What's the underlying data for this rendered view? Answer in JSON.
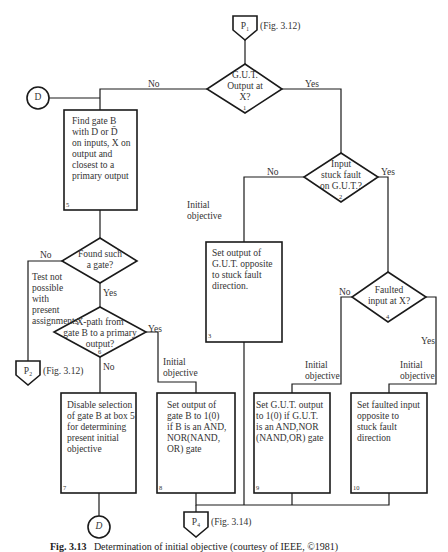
{
  "connectors": {
    "p1": {
      "label": "P₁",
      "ref": "(Fig. 3.12)"
    },
    "p2": {
      "label": "P₂",
      "ref": "(Fig. 3.12)"
    },
    "p4": {
      "label": "P₄",
      "ref": "(Fig. 3.14)"
    },
    "d_top": {
      "label": "D"
    },
    "d_bottom": {
      "label": "D"
    }
  },
  "decisions": [
    {
      "id": "1",
      "text": "G.U.T.\nOutput at\nX?",
      "number": "1"
    },
    {
      "id": "2",
      "text": "Input\nstuck fault\non G.U.T.?",
      "number": "2"
    },
    {
      "id": "4",
      "text": "Faulted\ninput at X?",
      "number": "4"
    },
    {
      "id": "found",
      "text": "Found such\na gate?"
    },
    {
      "id": "6",
      "text": "X-path from\ngate B to a primary\noutput?",
      "number": "6"
    }
  ],
  "processes": [
    {
      "id": "3",
      "text": "Set output of\nG.U.T. opposite\nto stuck fault\ndirection.",
      "number": "3"
    },
    {
      "id": "5",
      "text": "Find gate B\nwith D or D̄\non inputs, X on\noutput and\nclosest to a\nprimary output",
      "number": "5"
    },
    {
      "id": "7",
      "text": "Disable selection\nof gate B at box 5\nfor determining\npresent initial\nobjective",
      "number": "7"
    },
    {
      "id": "8",
      "text": "Set output of\ngate B to 1(0)\nif B is an AND,\nNOR(NAND,\nOR) gate",
      "number": "8"
    },
    {
      "id": "9",
      "text": "Set G.U.T. output\nto 1(0) if G.U.T.\nis an AND,NOR\n(NAND,OR) gate",
      "number": "9"
    },
    {
      "id": "10",
      "text": "Set faulted input\nopposite to\nstuck fault\ndirection",
      "number": "10"
    }
  ],
  "edge_labels": {
    "d1_no": "No",
    "d1_yes": "Yes",
    "d2_no": "No",
    "d2_yes": "Yes",
    "d4_no": "No",
    "d4_yes": "Yes",
    "found_no": "No",
    "found_yes": "Yes",
    "d6_yes": "Yes",
    "d6_no": "No",
    "initial_objective_3": "Initial\nobjective",
    "initial_objective_8": "Initial\nobjective",
    "initial_objective_9": "Initial\nobjective",
    "initial_objective_10": "Initial\nobjective",
    "test_not_possible": "Test not\npossible\nwith\npresent\nassignments"
  },
  "caption": {
    "fig": "Fig. 3.13",
    "text": "Determination of initial objective (courtesy of IEEE, ©1981)"
  }
}
